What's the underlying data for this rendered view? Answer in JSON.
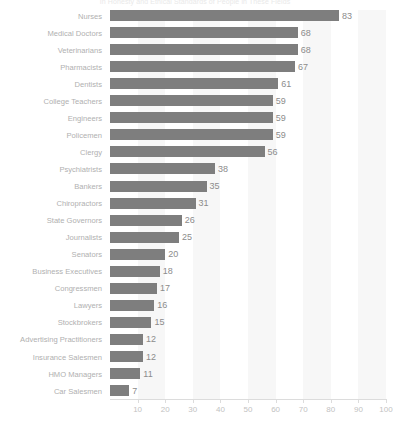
{
  "chart_data": {
    "type": "bar",
    "orientation": "horizontal",
    "title": "In Honesty and Ethical Standards of People in These Fields",
    "xlabel": "",
    "ylabel": "",
    "xlim": [
      0,
      100
    ],
    "xticks": [
      10,
      20,
      30,
      40,
      50,
      60,
      70,
      80,
      90,
      100
    ],
    "grid": "vertical-bands",
    "legend": "none",
    "bar_color": "#7e7e7e",
    "label_color": "#b0b0b0",
    "value_color": "#8c8c8c",
    "tick_color": "#c2c2c2",
    "band_color": "#f7f7f7",
    "categories": [
      "Nurses",
      "Medical Doctors",
      "Veterinarians",
      "Pharmacists",
      "Dentists",
      "College Teachers",
      "Engineers",
      "Policemen",
      "Clergy",
      "Psychiatrists",
      "Bankers",
      "Chiropractors",
      "State Governors",
      "Journalists",
      "Senators",
      "Business Executives",
      "Congressmen",
      "Lawyers",
      "Stockbrokers",
      "Advertising Practitioners",
      "Insurance Salesmen",
      "HMO Managers",
      "Car Salesmen"
    ],
    "values": [
      83,
      68,
      68,
      67,
      61,
      59,
      59,
      59,
      56,
      38,
      35,
      31,
      26,
      25,
      20,
      18,
      17,
      16,
      15,
      12,
      12,
      11,
      7
    ]
  }
}
